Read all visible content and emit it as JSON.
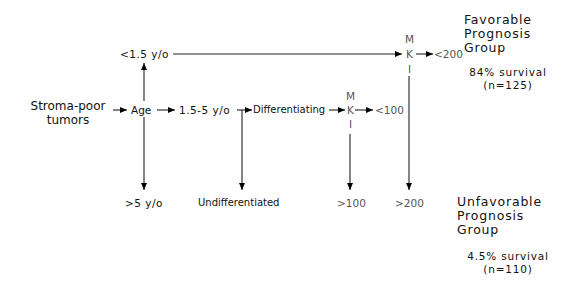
{
  "diagram": {
    "root": {
      "line1": "Stroma-poor",
      "line2": "tumors"
    },
    "age": "Age",
    "age_young": "<1.5 y/o",
    "age_mid": "1.5-5 y/o",
    "age_old": ">5 y/o",
    "differentiating": "Differentiating",
    "undifferentiated": "Undifferentiated",
    "mki_top": {
      "m": "M",
      "k": "K",
      "i": "I",
      "low": "<200",
      "high": ">200"
    },
    "mki_mid": {
      "m": "M",
      "k": "K",
      "i": "I",
      "low": "<100",
      "high": ">100"
    },
    "favorable": {
      "line1": "Favorable",
      "line2": "Prognosis",
      "line3": "Group",
      "survival": "84% survival",
      "n": "(n=125)"
    },
    "unfavorable": {
      "line1": "Unfavorable",
      "line2": "Prognosis",
      "line3": "Group",
      "survival": "4.5% survival",
      "n": "(n=110)"
    }
  }
}
